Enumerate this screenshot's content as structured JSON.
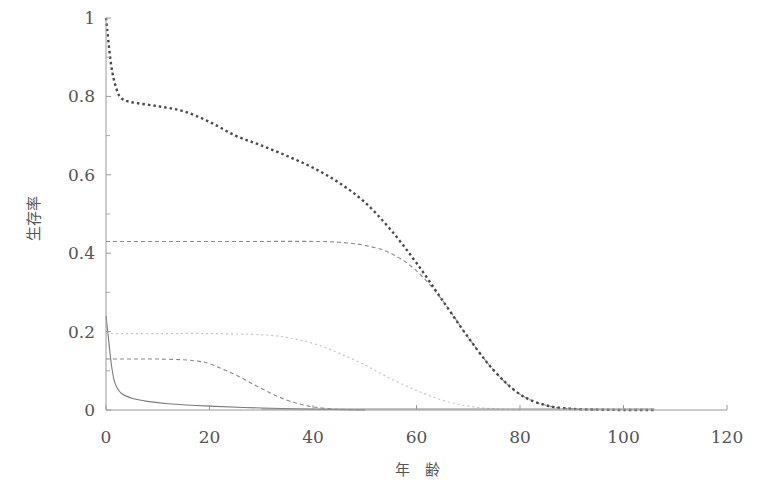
{
  "chart_data": {
    "type": "line",
    "title": "",
    "xlabel": "年　齢",
    "ylabel": "生存率",
    "xlim": [
      0,
      120
    ],
    "ylim": [
      0,
      1
    ],
    "grid": false,
    "legend": null,
    "x_ticks": [
      0,
      20,
      40,
      60,
      80,
      100,
      120
    ],
    "x_tick_labels": [
      "0",
      "20",
      "40",
      "60",
      "80",
      "100",
      "120"
    ],
    "y_ticks": [
      0,
      0.2,
      0.4,
      0.6,
      0.8,
      1
    ],
    "y_tick_labels": [
      "0",
      "0.2",
      "0.4",
      "0.6",
      "0.8",
      "1"
    ],
    "y_minor_ticks": [
      0.1,
      0.3,
      0.5,
      0.7,
      0.9
    ],
    "series": [
      {
        "name": "total",
        "style": "dotted-bold",
        "color": "#555555",
        "x": [
          0,
          1,
          2,
          3,
          5,
          10,
          15,
          20,
          25,
          30,
          35,
          40,
          45,
          50,
          55,
          60,
          65,
          70,
          75,
          80,
          85,
          90,
          95,
          100,
          106
        ],
        "y": [
          1.0,
          0.88,
          0.82,
          0.795,
          0.785,
          0.775,
          0.762,
          0.735,
          0.7,
          0.675,
          0.648,
          0.618,
          0.58,
          0.53,
          0.46,
          0.375,
          0.28,
          0.185,
          0.1,
          0.04,
          0.012,
          0.003,
          0.001,
          0.0,
          0.0
        ]
      },
      {
        "name": "component-0.43",
        "style": "dashed",
        "color": "#888888",
        "x": [
          0,
          10,
          20,
          30,
          40,
          45,
          50,
          55,
          60,
          65,
          70,
          75,
          80,
          85,
          90,
          95
        ],
        "y": [
          0.43,
          0.43,
          0.43,
          0.43,
          0.43,
          0.428,
          0.42,
          0.4,
          0.355,
          0.28,
          0.185,
          0.1,
          0.04,
          0.012,
          0.003,
          0.0
        ]
      },
      {
        "name": "component-0.195",
        "style": "dotted-light",
        "color": "#bbbbbb",
        "x": [
          0,
          10,
          20,
          30,
          35,
          40,
          45,
          50,
          55,
          60,
          65,
          70,
          75,
          80
        ],
        "y": [
          0.195,
          0.195,
          0.195,
          0.192,
          0.185,
          0.17,
          0.145,
          0.115,
          0.08,
          0.05,
          0.025,
          0.01,
          0.003,
          0.0
        ]
      },
      {
        "name": "component-0.13",
        "style": "dashed",
        "color": "#888888",
        "x": [
          0,
          5,
          10,
          15,
          18,
          20,
          25,
          30,
          35,
          40,
          45,
          50
        ],
        "y": [
          0.13,
          0.13,
          0.13,
          0.128,
          0.124,
          0.118,
          0.09,
          0.055,
          0.025,
          0.008,
          0.002,
          0.0
        ]
      },
      {
        "name": "component-infant",
        "style": "solid",
        "color": "#777777",
        "x": [
          0,
          0.5,
          1,
          1.5,
          2,
          3,
          5,
          8,
          12,
          20,
          30,
          40,
          50
        ],
        "y": [
          0.24,
          0.18,
          0.12,
          0.08,
          0.06,
          0.042,
          0.03,
          0.022,
          0.016,
          0.01,
          0.005,
          0.002,
          0.0
        ]
      }
    ]
  }
}
